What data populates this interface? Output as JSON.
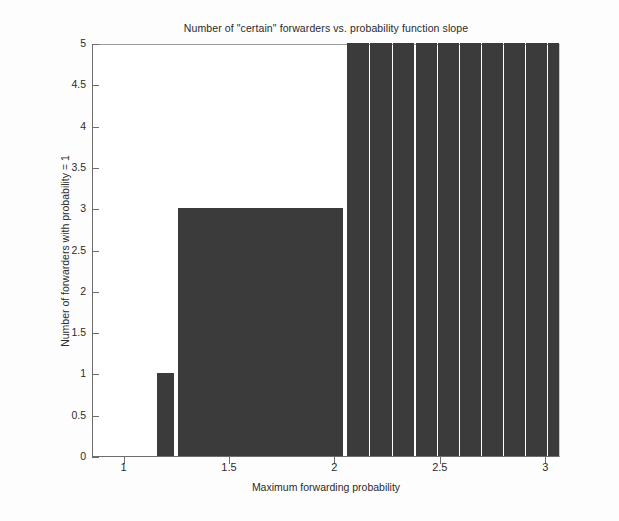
{
  "chart_data": {
    "type": "bar",
    "title": "Number of \"certain\" forwarders vs. probability function slope",
    "xlabel": "Maximum forwarding probability",
    "ylabel": "Number of forwarders with probability = 1",
    "xlim": [
      0.85,
      3.07
    ],
    "ylim": [
      0,
      5
    ],
    "xticks": [
      1,
      1.5,
      2,
      2.5,
      3
    ],
    "xtick_labels": [
      "1",
      "1.5",
      "2",
      "2.5",
      "3"
    ],
    "yticks": [
      0,
      0.5,
      1,
      1.5,
      2,
      2.5,
      3,
      3.5,
      4,
      4.5,
      5
    ],
    "ytick_labels": [
      "0",
      "0.5",
      "1",
      "1.5",
      "2",
      "2.5",
      "3",
      "3.5",
      "4",
      "4.5",
      "5"
    ],
    "grid": false,
    "legend": null,
    "bar_color": "#3b3b3b",
    "note": "Bars reaching 5 are clipped at the top of the axis.",
    "x": [
      1.205,
      1.305,
      1.405,
      1.505,
      1.605,
      1.705,
      1.805,
      1.905,
      2.005,
      2.055,
      2.16,
      2.265,
      2.37,
      2.475,
      2.58,
      2.685,
      2.79,
      2.895,
      3.0
    ],
    "values": [
      1,
      3,
      3,
      3,
      3,
      3,
      3,
      3,
      3,
      5,
      5,
      5,
      5,
      5,
      5,
      5,
      5,
      5,
      5
    ],
    "bars": [
      {
        "x0": 1.155,
        "x1": 1.235,
        "value": 1
      },
      {
        "x0": 1.255,
        "x1": 1.355,
        "value": 3
      },
      {
        "x0": 1.355,
        "x1": 1.455,
        "value": 3
      },
      {
        "x0": 1.455,
        "x1": 1.555,
        "value": 3
      },
      {
        "x0": 1.555,
        "x1": 1.655,
        "value": 3
      },
      {
        "x0": 1.655,
        "x1": 1.755,
        "value": 3
      },
      {
        "x0": 1.755,
        "x1": 1.855,
        "value": 3
      },
      {
        "x0": 1.855,
        "x1": 1.955,
        "value": 3
      },
      {
        "x0": 1.955,
        "x1": 2.035,
        "value": 3
      },
      {
        "x0": 2.055,
        "x1": 2.16,
        "value": 5
      },
      {
        "x0": 2.165,
        "x1": 2.27,
        "value": 5
      },
      {
        "x0": 2.275,
        "x1": 2.375,
        "value": 5
      },
      {
        "x0": 2.38,
        "x1": 2.48,
        "value": 5
      },
      {
        "x0": 2.485,
        "x1": 2.585,
        "value": 5
      },
      {
        "x0": 2.59,
        "x1": 2.69,
        "value": 5
      },
      {
        "x0": 2.695,
        "x1": 2.795,
        "value": 5
      },
      {
        "x0": 2.8,
        "x1": 2.9,
        "value": 5
      },
      {
        "x0": 2.905,
        "x1": 3.005,
        "value": 5
      },
      {
        "x0": 3.01,
        "x1": 3.06,
        "value": 5
      }
    ]
  }
}
